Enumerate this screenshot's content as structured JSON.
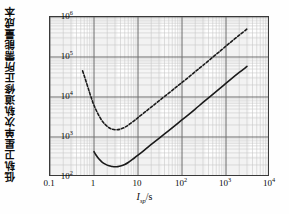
{
  "chart_data": {
    "type": "line",
    "title": "",
    "xlabel": "I_sp/s",
    "ylabel": "低轨卫星单次轨道修正所需能量成本",
    "xscale": "log",
    "yscale": "log",
    "xlim": [
      0.1,
      10000
    ],
    "ylim": [
      100,
      1000000
    ],
    "grid": true,
    "grid_minor": true,
    "legend": "none",
    "xticks": [
      "0.1",
      "1",
      "10",
      "10^2",
      "10^3",
      "10^4"
    ],
    "xtick_values": [
      0.1,
      1,
      10,
      100,
      1000,
      10000
    ],
    "yticks": [
      "10^2",
      "10^3",
      "10^4",
      "10^5",
      "10^6"
    ],
    "ytick_values": [
      100,
      1000,
      10000,
      100000,
      1000000
    ],
    "series": [
      {
        "name": "upper-curve",
        "style": "dashed",
        "color": "#1a1a1a",
        "x": [
          0.55,
          0.6,
          0.7,
          0.8,
          0.9,
          1.0,
          1.2,
          1.5,
          1.8,
          2.2,
          2.6,
          3.0,
          3.5,
          4.0,
          5.0,
          6.0,
          8.0,
          10,
          14,
          20,
          30,
          50,
          80,
          120,
          200,
          300,
          500,
          800,
          1200,
          2000,
          3000
        ],
        "y": [
          45000,
          34000,
          20000,
          12500,
          8500,
          6200,
          4000,
          2600,
          2050,
          1700,
          1570,
          1520,
          1530,
          1580,
          1750,
          1980,
          2500,
          3050,
          4100,
          5600,
          8000,
          12500,
          19000,
          27000,
          43000,
          62000,
          99000,
          152000,
          222000,
          350000,
          500000
        ]
      },
      {
        "name": "lower-curve",
        "style": "solid",
        "color": "#1a1a1a",
        "x": [
          1.0,
          1.1,
          1.3,
          1.5,
          1.8,
          2.2,
          2.6,
          3.0,
          3.5,
          4.0,
          5.0,
          6.0,
          8.0,
          10,
          14,
          20,
          30,
          50,
          80,
          120,
          200,
          300,
          500,
          800,
          1200,
          2000,
          3000
        ],
        "y": [
          430,
          360,
          280,
          240,
          210,
          190,
          183,
          180,
          182,
          188,
          205,
          230,
          290,
          350,
          470,
          650,
          930,
          1450,
          2200,
          3150,
          5000,
          7300,
          11600,
          17800,
          26000,
          41000,
          58000
        ]
      }
    ]
  },
  "axis": {
    "y_title": "低轨卫星单次轨道修正所需能量成本",
    "x_symbol": "I",
    "x_subscript": "sp",
    "x_unit": "/s",
    "xticks": [
      {
        "label": "0.1",
        "exp": ""
      },
      {
        "label": "1",
        "exp": ""
      },
      {
        "label": "10",
        "exp": ""
      },
      {
        "label": "10",
        "exp": "2"
      },
      {
        "label": "10",
        "exp": "3"
      },
      {
        "label": "10",
        "exp": "4"
      }
    ],
    "yticks": [
      {
        "label": "10",
        "exp": "6"
      },
      {
        "label": "10",
        "exp": "5"
      },
      {
        "label": "10",
        "exp": "4"
      },
      {
        "label": "10",
        "exp": "3"
      },
      {
        "label": "10",
        "exp": "2"
      }
    ]
  },
  "colors": {
    "frame": "#3a3a3a",
    "major_grid": "#6f6f6f",
    "minor_grid": "#c9c9c9",
    "curve": "#1a1a1a",
    "band": "#ededed",
    "background": "#ffffff"
  }
}
